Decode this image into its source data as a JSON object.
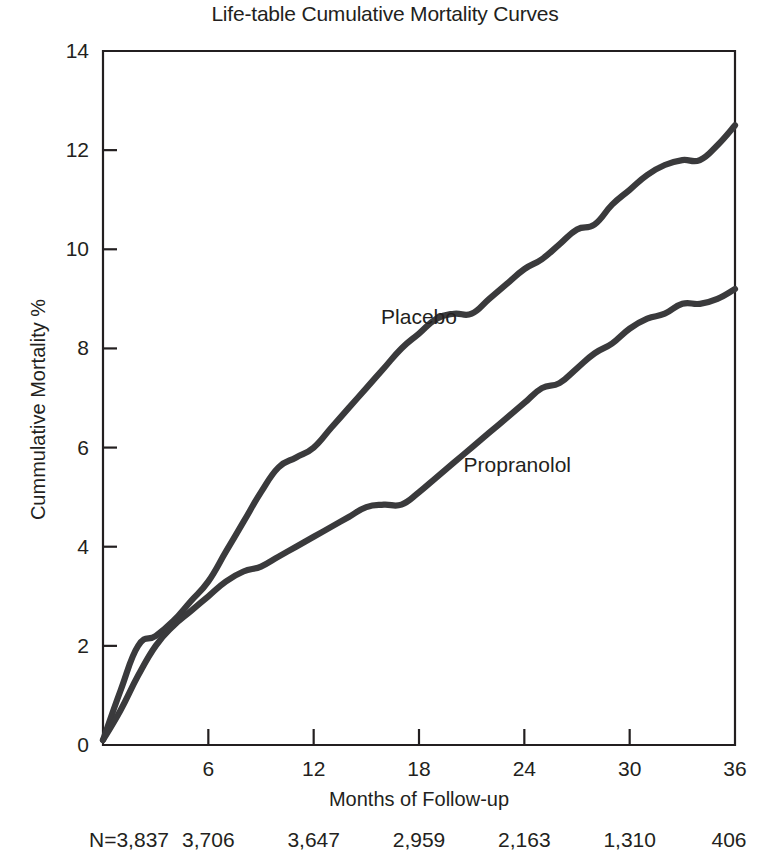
{
  "chart_data": {
    "type": "line",
    "title": "Life-table Cumulative Mortality Curves",
    "xlabel": "Months of Follow-up",
    "ylabel": "Cummulative Mortality %",
    "xlim": [
      0,
      36
    ],
    "ylim": [
      0,
      14
    ],
    "xticks": [
      6,
      12,
      18,
      24,
      30,
      36
    ],
    "xtick_labels": [
      "6",
      "12",
      "18",
      "24",
      "30",
      "36"
    ],
    "yticks": [
      0,
      2,
      4,
      6,
      8,
      10,
      12,
      14
    ],
    "ytick_labels": [
      "0",
      "2",
      "4",
      "6",
      "8",
      "10",
      "12",
      "14"
    ],
    "grid": false,
    "legend_position": "inline-annotation",
    "series": [
      {
        "name": "Placebo",
        "label_x": 18.0,
        "label_y": 8.6,
        "x": [
          0,
          1,
          2,
          3,
          4,
          5,
          6,
          7,
          8,
          9,
          10,
          11,
          12,
          13,
          14,
          15,
          16,
          17,
          18,
          19,
          20,
          21,
          22,
          23,
          24,
          25,
          26,
          27,
          28,
          29,
          30,
          31,
          32,
          33,
          34,
          35,
          36
        ],
        "y": [
          0.1,
          1.1,
          2.0,
          2.2,
          2.5,
          2.9,
          3.3,
          3.9,
          4.5,
          5.1,
          5.6,
          5.8,
          6.0,
          6.4,
          6.8,
          7.2,
          7.6,
          8.0,
          8.3,
          8.6,
          8.7,
          8.7,
          9.0,
          9.3,
          9.6,
          9.8,
          10.1,
          10.4,
          10.5,
          10.9,
          11.2,
          11.5,
          11.7,
          11.8,
          11.8,
          12.1,
          12.5
        ]
      },
      {
        "name": "Propranolol",
        "label_x": 23.6,
        "label_y": 5.6,
        "x": [
          0,
          1,
          2,
          3,
          4,
          5,
          6,
          7,
          8,
          9,
          10,
          11,
          12,
          13,
          14,
          15,
          16,
          17,
          18,
          19,
          20,
          21,
          22,
          23,
          24,
          25,
          26,
          27,
          28,
          29,
          30,
          31,
          32,
          33,
          34,
          35,
          36
        ],
        "y": [
          0.1,
          0.7,
          1.4,
          2.0,
          2.4,
          2.7,
          3.0,
          3.3,
          3.5,
          3.6,
          3.8,
          4.0,
          4.2,
          4.4,
          4.6,
          4.8,
          4.85,
          4.85,
          5.1,
          5.4,
          5.7,
          6.0,
          6.3,
          6.6,
          6.9,
          7.2,
          7.3,
          7.6,
          7.9,
          8.1,
          8.4,
          8.6,
          8.7,
          8.9,
          8.9,
          9.0,
          9.2
        ]
      }
    ],
    "footnote_row": {
      "label": "N=",
      "at_months": [
        0,
        6,
        12,
        18,
        24,
        30,
        36
      ],
      "values": [
        "3,837",
        "3,706",
        "3,647",
        "2,959",
        "2,163",
        "1,310",
        "406"
      ],
      "display": [
        "N=3,837",
        "3,706",
        "3,647",
        "2,959",
        "2,163",
        "1,310",
        "406"
      ]
    },
    "colors": {
      "axis": "#231f20",
      "curve": "#3a3a3c",
      "background": "#ffffff",
      "text": "#231f20"
    }
  }
}
